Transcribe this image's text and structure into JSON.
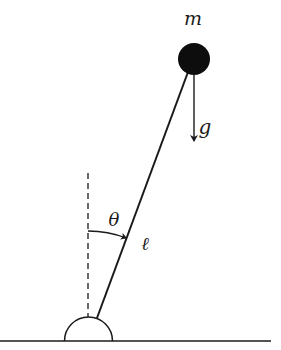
{
  "diagram": {
    "labels": {
      "mass": "m",
      "gravity": "g",
      "angle": "θ",
      "length": "ℓ"
    },
    "colors": {
      "stroke": "#1a1a1a",
      "bob": "#0d0d0d",
      "background": "#ffffff"
    },
    "components": [
      "ground-line",
      "pivot-semicircle",
      "vertical-dashed-reference",
      "rod",
      "bob",
      "gravity-arrow",
      "angle-arc"
    ]
  }
}
